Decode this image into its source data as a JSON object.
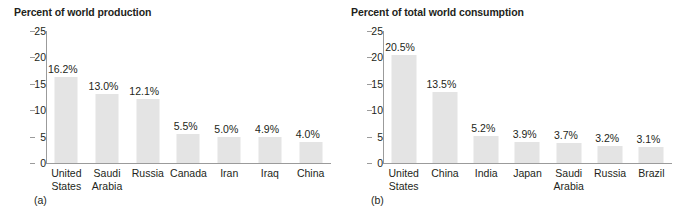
{
  "chart_data": [
    {
      "type": "bar",
      "panel": "(a)",
      "title": "Percent of world production",
      "xlabel": "",
      "ylabel": "",
      "ylim": [
        0,
        25
      ],
      "yticks": [
        0,
        5,
        10,
        15,
        20,
        25
      ],
      "grid": false,
      "legend": "none",
      "bar_color": "#e4e4e4",
      "axis_color": "#9b9b9b",
      "text_color": "#231f20",
      "categories": [
        "United States",
        "Saudi Arabia",
        "Russia",
        "Canada",
        "Iran",
        "Iraq",
        "China"
      ],
      "category_lines": [
        [
          "United",
          "States"
        ],
        [
          "Saudi",
          "Arabia"
        ],
        [
          "Russia",
          ""
        ],
        [
          "Canada",
          ""
        ],
        [
          "Iran",
          ""
        ],
        [
          "Iraq",
          ""
        ],
        [
          "China",
          ""
        ]
      ],
      "values": [
        16.2,
        13.0,
        12.1,
        5.5,
        5.0,
        4.9,
        4.0
      ],
      "value_labels": [
        "16.2%",
        "13.0%",
        "12.1%",
        "5.5%",
        "5.0%",
        "4.9%",
        "4.0%"
      ]
    },
    {
      "type": "bar",
      "panel": "(b)",
      "title": "Percent of total world consumption",
      "xlabel": "",
      "ylabel": "",
      "ylim": [
        0,
        25
      ],
      "yticks": [
        0,
        5,
        10,
        15,
        20,
        25
      ],
      "grid": false,
      "legend": "none",
      "bar_color": "#e4e4e4",
      "axis_color": "#9b9b9b",
      "text_color": "#231f20",
      "categories": [
        "United States",
        "China",
        "India",
        "Japan",
        "Saudi Arabia",
        "Russia",
        "Brazil"
      ],
      "category_lines": [
        [
          "United",
          "States"
        ],
        [
          "China",
          ""
        ],
        [
          "India",
          ""
        ],
        [
          "Japan",
          ""
        ],
        [
          "Saudi",
          "Arabia"
        ],
        [
          "Russia",
          ""
        ],
        [
          "Brazil",
          ""
        ]
      ],
      "values": [
        20.5,
        13.5,
        5.2,
        3.9,
        3.7,
        3.2,
        3.1
      ],
      "value_labels": [
        "20.5%",
        "13.5%",
        "5.2%",
        "3.9%",
        "3.7%",
        "3.2%",
        "3.1%"
      ]
    }
  ]
}
